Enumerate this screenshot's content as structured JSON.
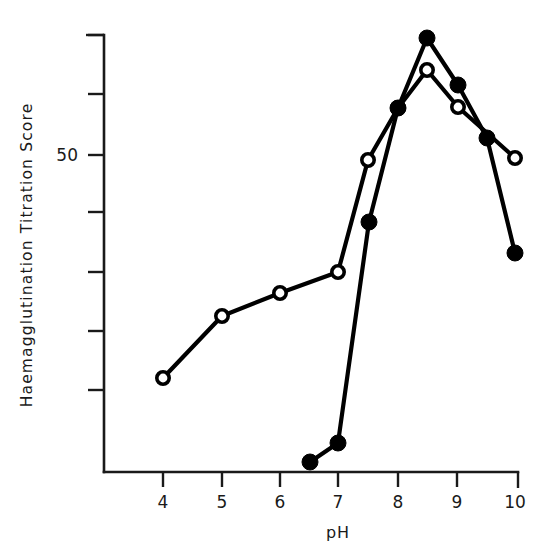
{
  "chart_data": {
    "type": "line",
    "title": "",
    "xlabel": "pH",
    "ylabel": "Haemagglutination Titration Score",
    "xlim": [
      3.5,
      10.3
    ],
    "ylim": [
      0,
      75
    ],
    "grid": false,
    "legend": "none",
    "x_ticks": [
      "4",
      "5",
      "6",
      "7",
      "8",
      "9",
      "10"
    ],
    "x_tick_values": [
      4,
      5,
      6,
      7,
      8,
      9,
      10
    ],
    "y_ticks": [
      "",
      "",
      "50",
      "",
      "",
      "",
      ""
    ],
    "y_tick_values": [
      75,
      65,
      50,
      40,
      30,
      20,
      10
    ],
    "y_labeled_tick": "50",
    "series": [
      {
        "name": "open-circle-series",
        "marker": "open-circle",
        "x": [
          4,
          5,
          6,
          7,
          7.5,
          8,
          8.5,
          9,
          10
        ],
        "values": [
          16,
          27,
          31,
          35,
          50,
          60,
          67,
          60,
          50
        ]
      },
      {
        "name": "filled-circle-series",
        "marker": "filled-circle",
        "x": [
          6.5,
          7,
          7.5,
          8,
          8.5,
          9,
          9.5,
          10
        ],
        "values": [
          1,
          5,
          43,
          60,
          73,
          63,
          54,
          38
        ]
      }
    ]
  },
  "geometry": {
    "axis": {
      "x_origin_px": 104,
      "y_bottom_px": 472,
      "y_top_px": 35,
      "x_right_px": 518,
      "x_unit_px": 58.6,
      "x_value_at_origin": 4,
      "x_origin_tick_px": 163
    },
    "y_tick_px": [
      35,
      94,
      155,
      212,
      272,
      331,
      390
    ],
    "x_tick_px": [
      163,
      222,
      280,
      338,
      398,
      457,
      515
    ],
    "series_px": [
      {
        "name": "open-circle-series",
        "marker": "open-circle",
        "points": [
          [
            163,
            378
          ],
          [
            222,
            316
          ],
          [
            280,
            293
          ],
          [
            338,
            272
          ],
          [
            368,
            160
          ],
          [
            398,
            108
          ],
          [
            427,
            70
          ],
          [
            458,
            107
          ],
          [
            515,
            158
          ]
        ]
      },
      {
        "name": "filled-circle-series",
        "marker": "filled-circle",
        "points": [
          [
            310,
            462
          ],
          [
            338,
            443
          ],
          [
            369,
            222
          ],
          [
            398,
            108
          ],
          [
            427,
            38
          ],
          [
            458,
            85
          ],
          [
            487,
            138
          ],
          [
            515,
            253
          ]
        ]
      }
    ]
  },
  "labels": {
    "y_axis_title": "Haemagglutination Titration Score",
    "x_axis_title": "pH",
    "y_value_50": "50",
    "x_tick_4": "4",
    "x_tick_5": "5",
    "x_tick_6": "6",
    "x_tick_7": "7",
    "x_tick_8": "8",
    "x_tick_9": "9",
    "x_tick_10": "10"
  },
  "colors": {
    "ink": "#1a1a1a",
    "line": "#000000",
    "background": "#ffffff",
    "marker_fill_open": "#ffffff",
    "marker_fill_closed": "#000000"
  }
}
